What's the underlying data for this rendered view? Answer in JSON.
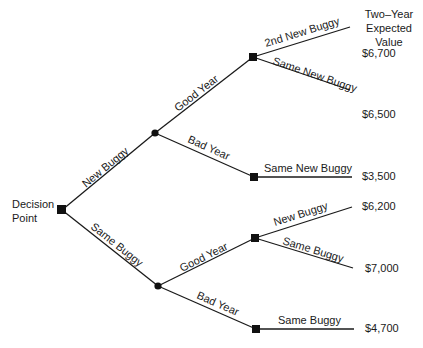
{
  "header": {
    "line1": "Two–Year",
    "line2": "Expected Value"
  },
  "root": {
    "line1": "Decision",
    "line2": "Point"
  },
  "branches": {
    "new_buggy": "New Buggy",
    "same_buggy": "Same Buggy",
    "nb_good_year": "Good Year",
    "nb_bad_year": "Bad Year",
    "sb_good_year": "Good Year",
    "sb_bad_year": "Bad Year",
    "nb_good_2nd": "2nd New Buggy",
    "nb_good_same": "Same New Buggy",
    "nb_bad_same": "Same New Buggy",
    "sb_good_new": "New Buggy",
    "sb_good_same": "Same Buggy",
    "sb_bad_same": "Same Buggy"
  },
  "values": {
    "v1": "$6,700",
    "v2": "$6,500",
    "v3": "$3,500",
    "v4": "$6,200",
    "v5": "$7,000",
    "v6": "$4,700"
  }
}
